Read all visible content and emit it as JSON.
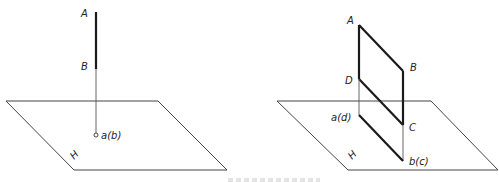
{
  "figure_left": {
    "plane_label": "H",
    "points": {
      "A": "A",
      "B": "B",
      "projection": "a(b)"
    },
    "description": "Line AB perpendicular to plane H projects to a point a(b)"
  },
  "figure_right": {
    "plane_label": "H",
    "points": {
      "A": "A",
      "B": "B",
      "C": "C",
      "D": "D",
      "proj_ad": "a(d)",
      "proj_bc": "b(c)"
    },
    "description": "Plane ABCD perpendicular to plane H projects to a line a(d)-b(c)"
  },
  "colors": {
    "line": "#1a1a1a",
    "plane": "#444444",
    "background": "#ffffff"
  }
}
